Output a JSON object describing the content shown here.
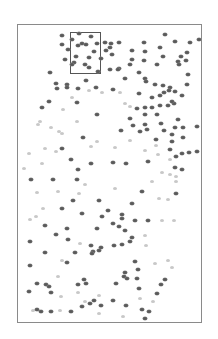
{
  "figure": {
    "frame": {
      "x": 17,
      "y": 24,
      "width": 185,
      "height": 299,
      "border_color": "#8a8a8a"
    },
    "highlight_box": {
      "x": 70,
      "y": 32,
      "width": 31,
      "height": 42,
      "border_color": "#555555"
    },
    "dot_colors": {
      "dark": "#5a5a5a",
      "light": "#c8c8c8"
    },
    "dots": [
      [
        62,
        35,
        "d"
      ],
      [
        79,
        33,
        "d"
      ],
      [
        91,
        36,
        "d"
      ],
      [
        72,
        39,
        "d"
      ],
      [
        82,
        43,
        "d"
      ],
      [
        97,
        43,
        "d"
      ],
      [
        62,
        44,
        "d"
      ],
      [
        86,
        44,
        "d"
      ],
      [
        78,
        45,
        "d"
      ],
      [
        105,
        42,
        "d"
      ],
      [
        111,
        43,
        "d"
      ],
      [
        119,
        42,
        "d"
      ],
      [
        68,
        49,
        "d"
      ],
      [
        94,
        51,
        "d"
      ],
      [
        106,
        50,
        "d"
      ],
      [
        110,
        47,
        "d"
      ],
      [
        112,
        54,
        "d"
      ],
      [
        76,
        56,
        "d"
      ],
      [
        89,
        57,
        "d"
      ],
      [
        65,
        59,
        "d"
      ],
      [
        74,
        62,
        "d"
      ],
      [
        101,
        58,
        "d"
      ],
      [
        85,
        64,
        "d"
      ],
      [
        72,
        64,
        "d"
      ],
      [
        89,
        67,
        "d"
      ],
      [
        98,
        71,
        "d"
      ],
      [
        110,
        69,
        "d"
      ],
      [
        119,
        68,
        "d"
      ],
      [
        50,
        72,
        "d"
      ],
      [
        86,
        80,
        "d"
      ],
      [
        56,
        83,
        "d"
      ],
      [
        67,
        84,
        "d"
      ],
      [
        57,
        88,
        "d"
      ],
      [
        67,
        87,
        "d"
      ],
      [
        78,
        88,
        "d"
      ],
      [
        96,
        87,
        "d"
      ],
      [
        72,
        97,
        "l"
      ],
      [
        89,
        90,
        "l"
      ],
      [
        102,
        92,
        "l"
      ],
      [
        113,
        89,
        "d"
      ],
      [
        120,
        92,
        "l"
      ],
      [
        165,
        34,
        "d"
      ],
      [
        175,
        41,
        "d"
      ],
      [
        199,
        39,
        "d"
      ],
      [
        190,
        42,
        "d"
      ],
      [
        144,
        42,
        "d"
      ],
      [
        160,
        47,
        "d"
      ],
      [
        132,
        50,
        "d"
      ],
      [
        145,
        51,
        "d"
      ],
      [
        163,
        56,
        "d"
      ],
      [
        187,
        52,
        "d"
      ],
      [
        181,
        56,
        "d"
      ],
      [
        132,
        59,
        "d"
      ],
      [
        144,
        60,
        "d"
      ],
      [
        157,
        64,
        "d"
      ],
      [
        186,
        60,
        "d"
      ],
      [
        178,
        61,
        "d"
      ],
      [
        130,
        64,
        "d"
      ],
      [
        179,
        64,
        "d"
      ],
      [
        188,
        74,
        "d"
      ],
      [
        118,
        69,
        "d"
      ],
      [
        139,
        72,
        "d"
      ],
      [
        145,
        78,
        "d"
      ],
      [
        125,
        78,
        "d"
      ],
      [
        146,
        81,
        "d"
      ],
      [
        163,
        85,
        "d"
      ],
      [
        170,
        87,
        "d"
      ],
      [
        187,
        84,
        "d"
      ],
      [
        155,
        84,
        "d"
      ],
      [
        169,
        90,
        "d"
      ],
      [
        164,
        92,
        "d"
      ],
      [
        182,
        95,
        "d"
      ],
      [
        175,
        91,
        "d"
      ],
      [
        160,
        95,
        "d"
      ],
      [
        152,
        97,
        "d"
      ],
      [
        139,
        93,
        "d"
      ],
      [
        49,
        101,
        "d"
      ],
      [
        42,
        107,
        "d"
      ],
      [
        77,
        102,
        "d"
      ],
      [
        63,
        109,
        "l"
      ],
      [
        97,
        114,
        "d"
      ],
      [
        40,
        121,
        "l"
      ],
      [
        38,
        124,
        "l"
      ],
      [
        51,
        127,
        "l"
      ],
      [
        77,
        121,
        "l"
      ],
      [
        59,
        131,
        "l"
      ],
      [
        62,
        133,
        "l"
      ],
      [
        83,
        137,
        "d"
      ],
      [
        97,
        141,
        "l"
      ],
      [
        62,
        148,
        "d"
      ],
      [
        91,
        146,
        "l"
      ],
      [
        45,
        148,
        "l"
      ],
      [
        56,
        151,
        "l"
      ],
      [
        29,
        153,
        "l"
      ],
      [
        71,
        159,
        "d"
      ],
      [
        91,
        163,
        "d"
      ],
      [
        42,
        163,
        "l"
      ],
      [
        24,
        168,
        "l"
      ],
      [
        78,
        169,
        "d"
      ],
      [
        125,
        103,
        "l"
      ],
      [
        130,
        106,
        "l"
      ],
      [
        137,
        108,
        "d"
      ],
      [
        145,
        107,
        "d"
      ],
      [
        152,
        107,
        "d"
      ],
      [
        160,
        105,
        "d"
      ],
      [
        168,
        105,
        "d"
      ],
      [
        174,
        103,
        "d"
      ],
      [
        172,
        101,
        "d"
      ],
      [
        145,
        114,
        "d"
      ],
      [
        157,
        114,
        "d"
      ],
      [
        130,
        118,
        "d"
      ],
      [
        133,
        125,
        "d"
      ],
      [
        145,
        124,
        "d"
      ],
      [
        161,
        123,
        "d"
      ],
      [
        178,
        119,
        "d"
      ],
      [
        175,
        127,
        "d"
      ],
      [
        183,
        127,
        "d"
      ],
      [
        197,
        126,
        "d"
      ],
      [
        121,
        130,
        "d"
      ],
      [
        140,
        131,
        "d"
      ],
      [
        147,
        129,
        "d"
      ],
      [
        164,
        130,
        "d"
      ],
      [
        172,
        134,
        "d"
      ],
      [
        130,
        140,
        "l"
      ],
      [
        156,
        139,
        "d"
      ],
      [
        172,
        141,
        "d"
      ],
      [
        183,
        137,
        "d"
      ],
      [
        156,
        145,
        "l"
      ],
      [
        170,
        149,
        "d"
      ],
      [
        176,
        156,
        "d"
      ],
      [
        182,
        153,
        "d"
      ],
      [
        115,
        147,
        "l"
      ],
      [
        145,
        150,
        "l"
      ],
      [
        158,
        154,
        "l"
      ],
      [
        189,
        152,
        "d"
      ],
      [
        197,
        151,
        "d"
      ],
      [
        170,
        159,
        "l"
      ],
      [
        175,
        167,
        "d"
      ],
      [
        182,
        169,
        "d"
      ],
      [
        126,
        163,
        "d"
      ],
      [
        113,
        162,
        "d"
      ],
      [
        148,
        161,
        "d"
      ],
      [
        162,
        172,
        "l"
      ],
      [
        31,
        179,
        "d"
      ],
      [
        53,
        179,
        "d"
      ],
      [
        77,
        179,
        "d"
      ],
      [
        85,
        184,
        "l"
      ],
      [
        37,
        192,
        "l"
      ],
      [
        58,
        191,
        "l"
      ],
      [
        79,
        193,
        "l"
      ],
      [
        73,
        200,
        "d"
      ],
      [
        99,
        200,
        "d"
      ],
      [
        43,
        208,
        "l"
      ],
      [
        36,
        216,
        "l"
      ],
      [
        62,
        208,
        "d"
      ],
      [
        82,
        213,
        "d"
      ],
      [
        108,
        210,
        "d"
      ],
      [
        30,
        219,
        "l"
      ],
      [
        102,
        216,
        "d"
      ],
      [
        45,
        225,
        "d"
      ],
      [
        67,
        228,
        "d"
      ],
      [
        97,
        228,
        "d"
      ],
      [
        56,
        234,
        "d"
      ],
      [
        68,
        239,
        "d"
      ],
      [
        30,
        241,
        "d"
      ],
      [
        80,
        243,
        "l"
      ],
      [
        91,
        245,
        "d"
      ],
      [
        101,
        247,
        "d"
      ],
      [
        170,
        174,
        "l"
      ],
      [
        176,
        176,
        "l"
      ],
      [
        152,
        181,
        "l"
      ],
      [
        176,
        181,
        "l"
      ],
      [
        115,
        188,
        "l"
      ],
      [
        142,
        191,
        "d"
      ],
      [
        159,
        198,
        "l"
      ],
      [
        168,
        199,
        "l"
      ],
      [
        176,
        193,
        "d"
      ],
      [
        132,
        203,
        "d"
      ],
      [
        122,
        214,
        "d"
      ],
      [
        122,
        218,
        "d"
      ],
      [
        113,
        223,
        "d"
      ],
      [
        119,
        226,
        "d"
      ],
      [
        135,
        220,
        "d"
      ],
      [
        148,
        220,
        "d"
      ],
      [
        162,
        220,
        "l"
      ],
      [
        174,
        220,
        "l"
      ],
      [
        125,
        230,
        "d"
      ],
      [
        132,
        237,
        "d"
      ],
      [
        145,
        235,
        "l"
      ],
      [
        130,
        241,
        "d"
      ],
      [
        122,
        244,
        "d"
      ],
      [
        114,
        245,
        "d"
      ],
      [
        146,
        245,
        "l"
      ],
      [
        45,
        252,
        "d"
      ],
      [
        75,
        252,
        "d"
      ],
      [
        93,
        251,
        "d"
      ],
      [
        99,
        250,
        "d"
      ],
      [
        92,
        253,
        "d"
      ],
      [
        62,
        260,
        "l"
      ],
      [
        67,
        262,
        "d"
      ],
      [
        30,
        265,
        "d"
      ],
      [
        58,
        276,
        "l"
      ],
      [
        86,
        283,
        "d"
      ],
      [
        84,
        279,
        "d"
      ],
      [
        37,
        283,
        "d"
      ],
      [
        46,
        284,
        "d"
      ],
      [
        49,
        286,
        "d"
      ],
      [
        78,
        284,
        "d"
      ],
      [
        29,
        291,
        "d"
      ],
      [
        51,
        292,
        "d"
      ],
      [
        78,
        292,
        "l"
      ],
      [
        61,
        296,
        "l"
      ],
      [
        99,
        295,
        "l"
      ],
      [
        94,
        300,
        "d"
      ],
      [
        85,
        301,
        "l"
      ],
      [
        90,
        303,
        "d"
      ],
      [
        101,
        305,
        "d"
      ],
      [
        82,
        306,
        "d"
      ],
      [
        33,
        310,
        "l"
      ],
      [
        37,
        309,
        "d"
      ],
      [
        41,
        311,
        "d"
      ],
      [
        51,
        311,
        "d"
      ],
      [
        60,
        310,
        "l"
      ],
      [
        71,
        311,
        "d"
      ],
      [
        99,
        313,
        "l"
      ],
      [
        135,
        261,
        "d"
      ],
      [
        138,
        269,
        "d"
      ],
      [
        125,
        272,
        "d"
      ],
      [
        124,
        276,
        "d"
      ],
      [
        127,
        278,
        "d"
      ],
      [
        137,
        278,
        "d"
      ],
      [
        155,
        263,
        "l"
      ],
      [
        168,
        260,
        "l"
      ],
      [
        172,
        267,
        "l"
      ],
      [
        165,
        279,
        "d"
      ],
      [
        116,
        283,
        "d"
      ],
      [
        139,
        288,
        "d"
      ],
      [
        161,
        284,
        "d"
      ],
      [
        157,
        293,
        "d"
      ],
      [
        113,
        300,
        "d"
      ],
      [
        140,
        298,
        "l"
      ],
      [
        126,
        305,
        "d"
      ],
      [
        153,
        301,
        "l"
      ],
      [
        142,
        309,
        "d"
      ],
      [
        149,
        311,
        "d"
      ],
      [
        145,
        318,
        "d"
      ],
      [
        123,
        316,
        "l"
      ]
    ]
  }
}
